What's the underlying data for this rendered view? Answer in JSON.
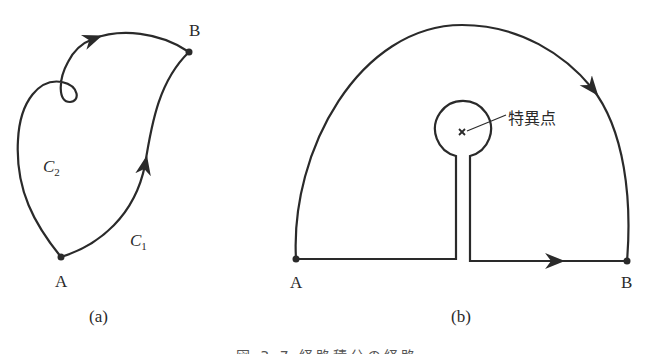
{
  "figure": {
    "panels": [
      {
        "id": "a",
        "label": "(a)",
        "points": [
          {
            "name": "A"
          },
          {
            "name": "B"
          }
        ],
        "paths": [
          {
            "name": "C",
            "subscript": "1",
            "description": "path from A to B along the right side, arrow pointing up"
          },
          {
            "name": "C",
            "subscript": "2",
            "description": "path from A to B along the left side with a small loop, arrow pointing right"
          }
        ]
      },
      {
        "id": "b",
        "label": "(b)",
        "points": [
          {
            "name": "A"
          },
          {
            "name": "B"
          }
        ],
        "singular_point_label": "特異点",
        "description": "semicircular contour from A to B over the top, and a straight path from A to B along the bottom detouring around a singular point via a keyhole"
      }
    ],
    "caption": "図 3.7 経路積分の経路"
  },
  "colors": {
    "stroke": "#2a2a2a",
    "background": "#ffffff"
  }
}
